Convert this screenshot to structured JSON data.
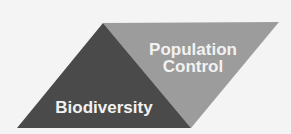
{
  "diagram": {
    "colors": {
      "background": "#f4f4f4",
      "dark_triangle": "#4a4a4a",
      "light_triangle": "#9c9c9c",
      "text": "#f2f2f2"
    },
    "segments": [
      {
        "id": "biodiversity",
        "label": "Biodiversity"
      },
      {
        "id": "population-control",
        "label_lines": [
          "Population",
          "Control"
        ]
      }
    ]
  }
}
